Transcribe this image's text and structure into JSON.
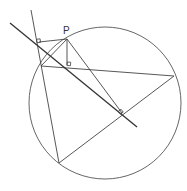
{
  "diagram": {
    "type": "geometry",
    "labels": {
      "P": "P"
    },
    "colors": {
      "stroke": "#444444",
      "simson_line": "#333333",
      "background": "#ffffff"
    },
    "circle": {
      "cx": 105,
      "cy": 103,
      "r": 76
    },
    "points": {
      "P": [
        67,
        39
      ],
      "A": [
        41,
        66
      ],
      "B": [
        174,
        76
      ],
      "C": [
        59,
        163
      ],
      "foot_CA": [
        39,
        42
      ],
      "foot_AB": [
        67,
        65
      ],
      "foot_BC": [
        122,
        113
      ]
    },
    "right_angle_markers": 3
  }
}
